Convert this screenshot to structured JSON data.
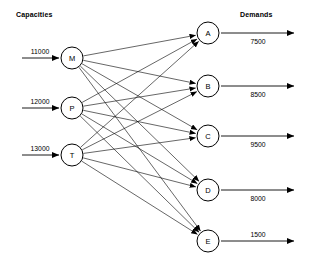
{
  "diagram": {
    "type": "bipartite-network",
    "width": 310,
    "height": 265,
    "background_color": "#ffffff",
    "line_color": "#000000"
  },
  "headings": {
    "left": "Capacities",
    "right": "Demands"
  },
  "sources": [
    {
      "id": "M",
      "label": "M",
      "capacity": "11000",
      "cx": 72,
      "cy": 58,
      "r": 11
    },
    {
      "id": "P",
      "label": "P",
      "capacity": "12000",
      "cx": 72,
      "cy": 108,
      "r": 11
    },
    {
      "id": "T",
      "label": "T",
      "capacity": "13000",
      "cx": 72,
      "cy": 155,
      "r": 11
    }
  ],
  "destinations": [
    {
      "id": "A",
      "label": "A",
      "demand": "7500",
      "cx": 208,
      "cy": 33,
      "r": 11
    },
    {
      "id": "B",
      "label": "B",
      "demand": "8500",
      "cx": 208,
      "cy": 86,
      "r": 11
    },
    {
      "id": "C",
      "label": "C",
      "demand": "9500",
      "cx": 208,
      "cy": 136,
      "r": 11
    },
    {
      "id": "D",
      "label": "D",
      "demand": "8000",
      "cx": 208,
      "cy": 190,
      "r": 11
    },
    {
      "id": "E",
      "label": "E",
      "demand": "1500",
      "cx": 208,
      "cy": 241,
      "r": 11
    }
  ],
  "edges": [
    {
      "from": "M",
      "to": "A"
    },
    {
      "from": "M",
      "to": "B"
    },
    {
      "from": "M",
      "to": "C"
    },
    {
      "from": "M",
      "to": "D"
    },
    {
      "from": "M",
      "to": "E"
    },
    {
      "from": "P",
      "to": "A"
    },
    {
      "from": "P",
      "to": "B"
    },
    {
      "from": "P",
      "to": "C"
    },
    {
      "from": "P",
      "to": "D"
    },
    {
      "from": "P",
      "to": "E"
    },
    {
      "from": "T",
      "to": "A"
    },
    {
      "from": "T",
      "to": "B"
    },
    {
      "from": "T",
      "to": "C"
    },
    {
      "from": "T",
      "to": "D"
    },
    {
      "from": "T",
      "to": "E"
    }
  ],
  "inflow_arrows": [
    {
      "node": "M",
      "value": "11000",
      "x1": 22,
      "x2": 59,
      "y": 58,
      "label_x": 40,
      "label_y": 54
    },
    {
      "node": "P",
      "value": "12000",
      "x1": 22,
      "x2": 59,
      "y": 108,
      "label_x": 40,
      "label_y": 104
    },
    {
      "node": "T",
      "value": "13000",
      "x1": 22,
      "x2": 59,
      "y": 155,
      "label_x": 40,
      "label_y": 151
    }
  ],
  "outflow_arrows": [
    {
      "node": "A",
      "value": "7500",
      "x1": 221,
      "x2": 294,
      "y": 33,
      "label_x": 258,
      "label_y": 44,
      "label_pos": "below"
    },
    {
      "node": "B",
      "value": "8500",
      "x1": 221,
      "x2": 294,
      "y": 86,
      "label_x": 258,
      "label_y": 97,
      "label_pos": "below"
    },
    {
      "node": "C",
      "value": "9500",
      "x1": 221,
      "x2": 294,
      "y": 136,
      "label_x": 258,
      "label_y": 147,
      "label_pos": "below"
    },
    {
      "node": "D",
      "value": "8000",
      "x1": 221,
      "x2": 294,
      "y": 190,
      "label_x": 258,
      "label_y": 201,
      "label_pos": "below"
    },
    {
      "node": "E",
      "value": "1500",
      "x1": 221,
      "x2": 294,
      "y": 241,
      "label_x": 258,
      "label_y": 237,
      "label_pos": "above"
    }
  ],
  "heading_positions": {
    "left": {
      "x": 16,
      "y": 17
    },
    "right": {
      "x": 240,
      "y": 17
    }
  }
}
